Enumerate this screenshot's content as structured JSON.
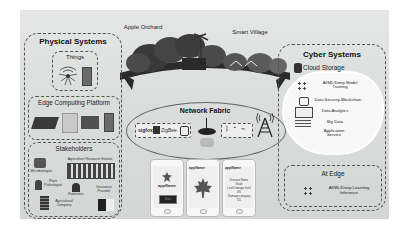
{
  "scene": {
    "apple_orchard_label": "Apple Orchard",
    "smart_village_label": "Smart Village"
  },
  "physical_systems": {
    "title": "Physical Systems",
    "things": {
      "title": "Things",
      "icons": [
        "sensor-icon",
        "device-icon"
      ]
    },
    "edge_platform": {
      "title": "Edge Computing Platform",
      "icons": [
        "raspberry-pi-icon",
        "server-icon",
        "arduino-icon",
        "phone-icon"
      ]
    },
    "stakeholders": {
      "title": "Stakeholders",
      "items": [
        {
          "label": "Microbiologist"
        },
        {
          "label": "Agriculture Research Station"
        },
        {
          "label": "Plant Pathologist"
        },
        {
          "label": "Extension"
        },
        {
          "label": "Insurance Provider"
        },
        {
          "label": "Agricultural Company"
        }
      ]
    }
  },
  "network_fabric": {
    "title": "Network Fabric",
    "protocols": [
      "sigfox",
      "ZigBee"
    ],
    "icons": [
      "lora-icon",
      "router-icon",
      "bluetooth-icon",
      "wifi-icon",
      "satellite-icon",
      "cell-tower-icon"
    ]
  },
  "phones": [
    {
      "app_name": "appName",
      "button": "Start"
    },
    {
      "app_name": "appName"
    },
    {
      "app_name": "appName",
      "lines": [
        "Disease Name",
        "Scab",
        "Leaf Damage level",
        "4%",
        "Damage category",
        "D1"
      ]
    }
  ],
  "cyber_systems": {
    "title": "Cyber Systems",
    "cloud": {
      "title": "Cloud Storage",
      "items": [
        {
          "label": "AI/ML/Deep Model Training"
        },
        {
          "label": "Data Security-Blockchain"
        },
        {
          "label": "Data Analytics"
        },
        {
          "label": "Big Data"
        },
        {
          "label": "Application Service"
        }
      ]
    },
    "at_edge": {
      "title": "At Edge",
      "label": "AI/ML/Deep Learning  Inference"
    }
  }
}
